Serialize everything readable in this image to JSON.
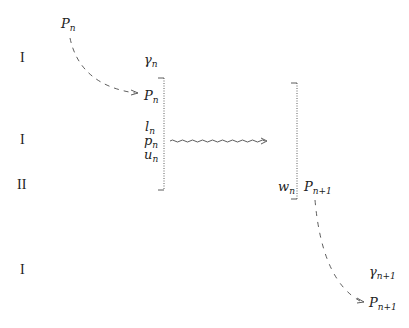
{
  "diagram": {
    "row_labels": [
      {
        "text": "I",
        "x": 20,
        "y": 54
      },
      {
        "text": "I",
        "x": 20,
        "y": 135
      },
      {
        "text": "II",
        "x": 17,
        "y": 180
      },
      {
        "text": "I",
        "x": 20,
        "y": 265
      }
    ],
    "top_left": {
      "base": "P",
      "sub": "n"
    },
    "gamma_n": {
      "base": "γ",
      "sub": "n"
    },
    "bracket_left_items": [
      {
        "base": "P",
        "sub": "n"
      },
      {
        "base": "l",
        "sub": "n"
      },
      {
        "base": "p",
        "sub": "n"
      },
      {
        "base": "u",
        "sub": "n"
      }
    ],
    "w_n": {
      "base": "w",
      "sub": "n"
    },
    "p_next": {
      "base": "P",
      "sub": "n+1"
    },
    "gamma_next": {
      "base": "γ",
      "sub": "n+1"
    },
    "p_next_bottom": {
      "base": "P",
      "sub": "n+1"
    },
    "arrows": [
      {
        "type": "dashed-curve",
        "from": "P_n (top)",
        "to": "P_n (bracket)"
      },
      {
        "type": "wavy",
        "from": "left bracket",
        "to": "right bracket"
      },
      {
        "type": "dashed-curve",
        "from": "P_n+1",
        "to": "P_n+1 (bottom)"
      }
    ],
    "line_color": "#333333"
  }
}
